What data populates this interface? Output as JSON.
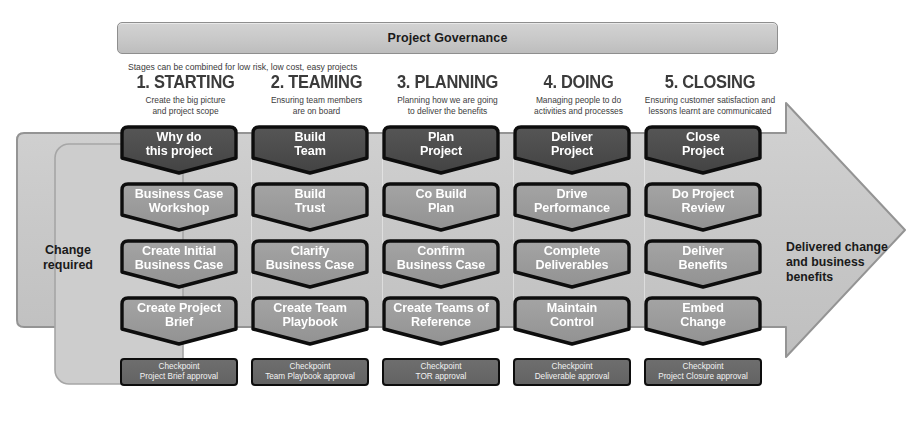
{
  "governance": {
    "label": "Project Governance"
  },
  "note": "Stages can be combined for low risk, low cost, easy projects",
  "side_labels": {
    "left": "Change\nrequired",
    "left_line1": "Change",
    "left_line2": "required",
    "right_line1": "Delivered change",
    "right_line2": "and business",
    "right_line3": "benefits"
  },
  "colors": {
    "arrow_body": "#c9c9c9",
    "arrow_outline": "#8e8e8e",
    "left_panel": "#cfcfcf",
    "step_dark": "#4a4a4a",
    "step_light": "#999999",
    "checkpoint": "#686868",
    "box_outline": "#0d0d0d",
    "text_on_box": "#ffffff",
    "title_text": "#3b3b3b"
  },
  "columns": [
    {
      "title": "1. STARTING",
      "subtitle_l1": "Create the big picture",
      "subtitle_l2": "and project scope",
      "steps": [
        {
          "l1": "Why do",
          "l2": "this project",
          "tone": "dark"
        },
        {
          "l1": "Business Case",
          "l2": "Workshop",
          "tone": "light"
        },
        {
          "l1": "Create Initial",
          "l2": "Business Case",
          "tone": "light"
        },
        {
          "l1": "Create Project",
          "l2": "Brief",
          "tone": "light"
        }
      ],
      "checkpoint": {
        "l1": "Checkpoint",
        "l2": "Project Brief approval"
      }
    },
    {
      "title": "2. TEAMING",
      "subtitle_l1": "Ensuring team members",
      "subtitle_l2": "are on board",
      "steps": [
        {
          "l1": "Build",
          "l2": "Team",
          "tone": "dark"
        },
        {
          "l1": "Build",
          "l2": "Trust",
          "tone": "light"
        },
        {
          "l1": "Clarify",
          "l2": "Business Case",
          "tone": "light"
        },
        {
          "l1": "Create Team",
          "l2": "Playbook",
          "tone": "light"
        }
      ],
      "checkpoint": {
        "l1": "Checkpoint",
        "l2": "Team Playbook approval"
      }
    },
    {
      "title": "3. PLANNING",
      "subtitle_l1": "Planning how we are going",
      "subtitle_l2": "to deliver the benefits",
      "steps": [
        {
          "l1": "Plan",
          "l2": "Project",
          "tone": "dark"
        },
        {
          "l1": "Co Build",
          "l2": "Plan",
          "tone": "light"
        },
        {
          "l1": "Confirm",
          "l2": "Business Case",
          "tone": "light"
        },
        {
          "l1": "Create Teams of",
          "l2": "Reference",
          "tone": "light"
        }
      ],
      "checkpoint": {
        "l1": "Checkpoint",
        "l2": "TOR approval"
      }
    },
    {
      "title": "4. DOING",
      "subtitle_l1": "Managing people to do",
      "subtitle_l2": "activities and processes",
      "steps": [
        {
          "l1": "Deliver",
          "l2": "Project",
          "tone": "dark"
        },
        {
          "l1": "Drive",
          "l2": "Performance",
          "tone": "light"
        },
        {
          "l1": "Complete",
          "l2": "Deliverables",
          "tone": "light"
        },
        {
          "l1": "Maintain",
          "l2": "Control",
          "tone": "light"
        }
      ],
      "checkpoint": {
        "l1": "Checkpoint",
        "l2": "Deliverable approval"
      }
    },
    {
      "title": "5. CLOSING",
      "subtitle_l1": "Ensuring customer satisfaction and",
      "subtitle_l2": "lessons learnt are communicated",
      "steps": [
        {
          "l1": "Close",
          "l2": "Project",
          "tone": "dark"
        },
        {
          "l1": "Do Project",
          "l2": "Review",
          "tone": "light"
        },
        {
          "l1": "Deliver",
          "l2": "Benefits",
          "tone": "light"
        },
        {
          "l1": "Embed",
          "l2": "Change",
          "tone": "light"
        }
      ],
      "checkpoint": {
        "l1": "Checkpoint",
        "l2": "Project Closure approval"
      }
    }
  ]
}
